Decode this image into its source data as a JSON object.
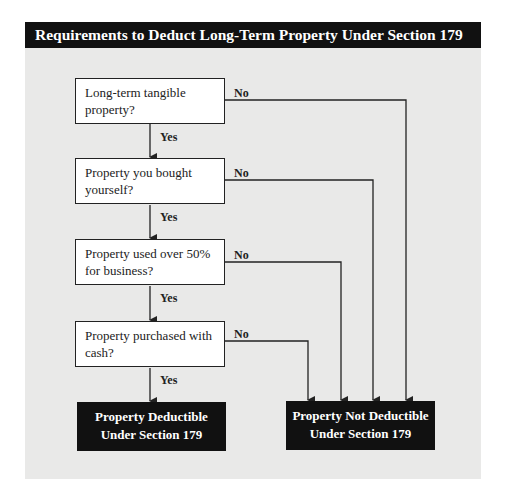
{
  "title": "Requirements to Deduct Long-Term Property Under Section 179",
  "questions": [
    {
      "text": "Long-term tangible property?",
      "yes": "Yes",
      "no": "No"
    },
    {
      "text": "Property you bought yourself?",
      "yes": "Yes",
      "no": "No"
    },
    {
      "text": "Property used over 50% for business?",
      "yes": "Yes",
      "no": "No"
    },
    {
      "text": "Property purchased with cash?",
      "yes": "Yes",
      "no": "No"
    }
  ],
  "outcomes": {
    "deductible": "Property Deductible Under Section 179",
    "not_deductible": "Property Not Deductible Under Section 179"
  },
  "colors": {
    "header_bg": "#111111",
    "panel_bg": "#e9e9e8",
    "line": "#222222"
  }
}
